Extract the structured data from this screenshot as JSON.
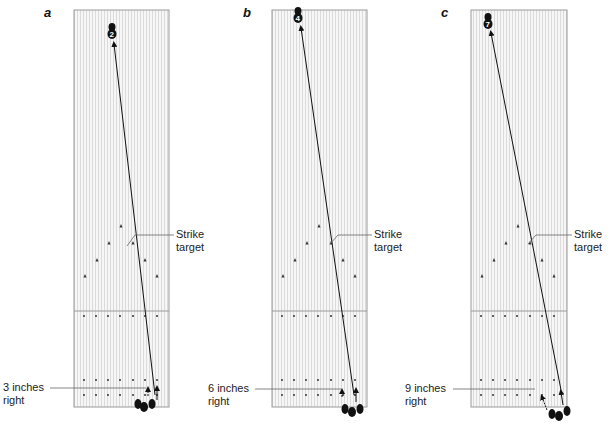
{
  "figure": {
    "panels": [
      {
        "letter": "a",
        "pin_number": "2",
        "offset_label_line1": "3 inches",
        "offset_label_line2": "right",
        "target_label_line1": "Strike",
        "target_label_line2": "target"
      },
      {
        "letter": "b",
        "pin_number": "4",
        "offset_label_line1": "6 inches",
        "offset_label_line2": "right",
        "target_label_line1": "Strike",
        "target_label_line2": "target"
      },
      {
        "letter": "c",
        "pin_number": "7",
        "offset_label_line1": "9 inches",
        "offset_label_line2": "right",
        "target_label_line1": "Strike",
        "target_label_line2": "target"
      }
    ],
    "colors": {
      "lane_fill": "#f4f4f4",
      "lane_board_line": "#d6d6d6",
      "lane_border": "#9a9a9a",
      "ink": "#111111",
      "leader_line": "#666666"
    }
  }
}
